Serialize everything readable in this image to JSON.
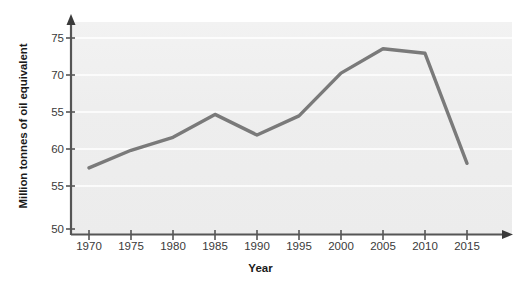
{
  "chart_data": {
    "type": "line",
    "title": "",
    "xlabel": "Year",
    "ylabel": "Million tonnes of oil equivalent",
    "categories": [
      "1970",
      "1975",
      "1980",
      "1985",
      "1990",
      "1995",
      "2000",
      "2005",
      "2010",
      "2015"
    ],
    "x": [
      1970,
      1975,
      1980,
      1985,
      1990,
      1995,
      2000,
      2005,
      2010,
      2015
    ],
    "values": [
      58.0,
      60.3,
      62.0,
      65.0,
      62.3,
      64.8,
      70.4,
      73.6,
      73.0,
      58.6
    ],
    "series": [
      {
        "name": "Energy consumption",
        "values": [
          58.0,
          60.3,
          62.0,
          65.0,
          62.3,
          64.8,
          70.4,
          73.6,
          73.0,
          58.6
        ]
      }
    ],
    "ytick_labels": [
      "75",
      "70",
      "55",
      "60",
      "55",
      "50"
    ],
    "ytick_values": [
      75,
      70,
      65,
      60,
      55,
      50
    ],
    "ylim": [
      50,
      77
    ],
    "xlim": [
      1968,
      2019
    ],
    "grid": true,
    "grid_axis": "y",
    "legend": false,
    "legend_position": "none",
    "line_color": "#7a7a7a",
    "plot_background": "#efefef",
    "axis_color": "#555555",
    "text_color": "#2b2b2b"
  },
  "axes": {
    "y_title": "Million tonnes of oil equivalent",
    "x_title": "Year",
    "y_ticks": [
      {
        "label": "75"
      },
      {
        "label": "70"
      },
      {
        "label": "55"
      },
      {
        "label": "60"
      },
      {
        "label": "55"
      },
      {
        "label": "50"
      }
    ],
    "x_ticks": [
      {
        "label": "1970"
      },
      {
        "label": "1975"
      },
      {
        "label": "1980"
      },
      {
        "label": "1985"
      },
      {
        "label": "1990"
      },
      {
        "label": "1995"
      },
      {
        "label": "2000"
      },
      {
        "label": "2005"
      },
      {
        "label": "2010"
      },
      {
        "label": "2015"
      }
    ]
  }
}
